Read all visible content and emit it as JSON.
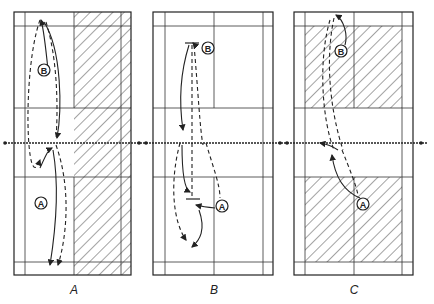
{
  "diagrams": [
    {
      "label": "A",
      "player_top": "B",
      "player_bottom": "A"
    },
    {
      "label": "B",
      "player_top": "B",
      "player_bottom": "A"
    },
    {
      "label": "C",
      "player_top": "B",
      "player_bottom": "A"
    }
  ],
  "colors": {
    "ink": "#222222",
    "background": "#ffffff"
  }
}
